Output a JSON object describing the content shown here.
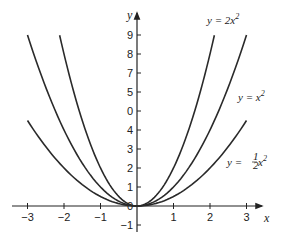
{
  "chart_data": {
    "type": "line",
    "title": "",
    "xlabel": "x",
    "ylabel": "y",
    "xlim": [
      -3.3,
      3.5
    ],
    "ylim": [
      -1.5,
      10
    ],
    "grid": false,
    "legend_position": "inline labels near curves (right side)",
    "x_ticks": [
      -3,
      -2,
      -1,
      1,
      2,
      3
    ],
    "x_tick_labels": [
      "−3",
      "−2",
      "−1",
      "1",
      "2",
      "3"
    ],
    "y_ticks": [
      -1,
      0,
      1,
      2,
      3,
      4,
      5,
      6,
      7,
      8,
      9
    ],
    "y_tick_labels": [
      "−1",
      "0",
      "1",
      "2",
      "3",
      "4",
      "0",
      "5",
      "7",
      "8",
      "9"
    ],
    "series": [
      {
        "name": "y = 2x²",
        "label_main": "y = 2x",
        "label_sup": "2",
        "coef": 2,
        "x": [
          -2.12,
          -2,
          -1.5,
          -1,
          -0.5,
          0,
          0.5,
          1,
          1.5,
          2,
          2.12
        ],
        "values": [
          9,
          8,
          4.5,
          2,
          0.5,
          0,
          0.5,
          2,
          4.5,
          8,
          9
        ]
      },
      {
        "name": "y = x²",
        "label_main": "y = x",
        "label_sup": "2",
        "coef": 1,
        "x": [
          -3,
          -2,
          -1,
          0,
          1,
          2,
          3
        ],
        "values": [
          9,
          4,
          1,
          0,
          1,
          4,
          9
        ]
      },
      {
        "name": "y = ½x²",
        "label_main": "y = ½x",
        "label_sup": "2",
        "coef": 0.5,
        "x": [
          -3,
          -2,
          -1,
          0,
          1,
          2,
          3
        ],
        "values": [
          4.5,
          2,
          0.5,
          0,
          0.5,
          2,
          4.5
        ]
      }
    ]
  },
  "labels": {
    "x_axis": "x",
    "y_axis": "y",
    "origin": "0",
    "curve_2x2": "y = 2x",
    "curve_x2": "y = x",
    "curve_half_main": "y = ",
    "curve_half_frac_num": "1",
    "curve_half_frac_den": "2",
    "curve_half_tail": "x",
    "sup": "2"
  }
}
